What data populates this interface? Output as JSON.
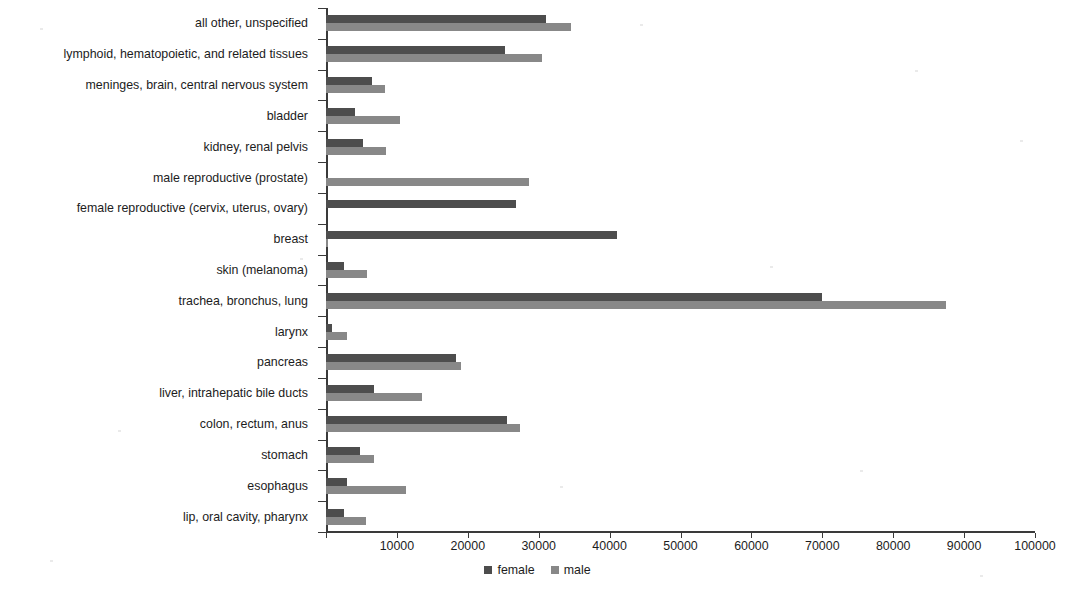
{
  "chart_data": {
    "type": "bar",
    "orientation": "horizontal",
    "title": "",
    "subtitle": "",
    "xlabel": "",
    "ylabel": "",
    "xlim": [
      0,
      100000
    ],
    "xtick_step": 10000,
    "xticks": [
      0,
      10000,
      20000,
      30000,
      40000,
      50000,
      60000,
      70000,
      80000,
      90000,
      100000
    ],
    "xtick_labels": [
      "",
      "10000",
      "20000",
      "30000",
      "40000",
      "50000",
      "60000",
      "70000",
      "80000",
      "90000",
      "100000"
    ],
    "grid": false,
    "legend_position": "bottom-center",
    "categories": [
      "all other, unspecified",
      "lymphoid, hematopoietic, and related tissues",
      "meninges, brain, central nervous system",
      "bladder",
      "kidney, renal pelvis",
      "male reproductive (prostate)",
      "female reproductive (cervix, uterus, ovary)",
      "breast",
      "skin (melanoma)",
      "trachea, bronchus, lung",
      "larynx",
      "pancreas",
      "liver, intrahepatic bile ducts",
      "colon, rectum, anus",
      "stomach",
      "esophagus",
      "lip, oral cavity, pharynx"
    ],
    "series": [
      {
        "name": "female",
        "color": "#4d4d4d",
        "values": [
          31000,
          25300,
          6500,
          4100,
          5200,
          0,
          26800,
          41000,
          2600,
          70000,
          800,
          18300,
          6800,
          25500,
          4800,
          2900,
          2600
        ]
      },
      {
        "name": "male",
        "color": "#888888",
        "values": [
          34500,
          30400,
          8300,
          10500,
          8400,
          28600,
          0,
          300,
          5800,
          87500,
          3000,
          19000,
          13500,
          27300,
          6800,
          11300,
          5700
        ]
      }
    ]
  },
  "legend": {
    "items": [
      {
        "label": "female",
        "swatch": "female-swatch"
      },
      {
        "label": "male",
        "swatch": "male-swatch"
      }
    ]
  }
}
